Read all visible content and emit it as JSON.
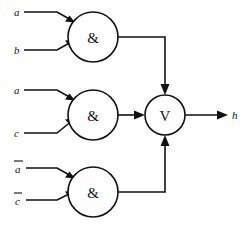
{
  "diagram": {
    "background_color": "#ffffff",
    "line_color": "#111111",
    "gates": [
      {
        "id": "and-top",
        "type": "AND",
        "glyph": "&",
        "center_x": 93,
        "center_y": 37,
        "radius": 25,
        "inputs": [
          "a",
          "b"
        ],
        "output_to": "or-gate-top-port"
      },
      {
        "id": "and-middle",
        "type": "AND",
        "glyph": "&",
        "center_x": 93,
        "center_y": 115,
        "radius": 25,
        "inputs": [
          "a",
          "c"
        ],
        "output_to": "or-gate-left-port"
      },
      {
        "id": "and-bottom",
        "type": "AND",
        "glyph": "&",
        "center_x": 93,
        "center_y": 192,
        "radius": 25,
        "inputs": [
          "a-bar",
          "c-bar"
        ],
        "output_to": "or-gate-bottom-port"
      },
      {
        "id": "or-gate",
        "type": "OR",
        "glyph": "V",
        "center_x": 165,
        "center_y": 115,
        "radius": 20,
        "inputs": [
          "and-top",
          "and-middle",
          "and-bottom"
        ],
        "output_to": "h"
      }
    ],
    "input_labels": [
      {
        "id": "in-a-1",
        "text": "a",
        "overbar": false,
        "x": 16,
        "y": 12
      },
      {
        "id": "in-b",
        "text": "b",
        "overbar": false,
        "x": 16,
        "y": 50
      },
      {
        "id": "in-a-2",
        "text": "a",
        "overbar": false,
        "x": 16,
        "y": 90
      },
      {
        "id": "in-c",
        "text": "c",
        "overbar": false,
        "x": 16,
        "y": 133
      },
      {
        "id": "in-a-bar",
        "text": "a",
        "overbar": true,
        "x": 16,
        "y": 168
      },
      {
        "id": "in-c-bar",
        "text": "c",
        "overbar": true,
        "x": 16,
        "y": 200
      }
    ],
    "output_label": {
      "id": "out-h",
      "text": "h",
      "overbar": false,
      "x": 234,
      "y": 115
    }
  }
}
